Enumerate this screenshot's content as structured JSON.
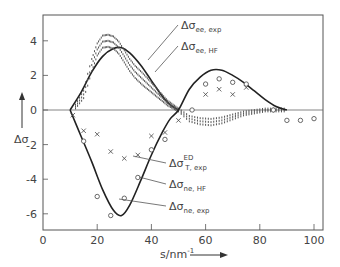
{
  "chart_data": {
    "type": "line",
    "title": "",
    "xlabel": "s/nm⁻¹",
    "ylabel": "Δσ",
    "xlim": [
      0,
      105
    ],
    "ylim": [
      -7,
      5.6
    ],
    "xticks": [
      0,
      20,
      40,
      60,
      80,
      100
    ],
    "yticks": [
      -6,
      -4,
      -2,
      0,
      2,
      4
    ],
    "grid": false,
    "zero_line": true,
    "series": [
      {
        "name": "Δσ_ee,HF",
        "style": "solid-line",
        "x": [
          10,
          14,
          18,
          22,
          26,
          29,
          32,
          36,
          40,
          44,
          47,
          50
        ],
        "y": [
          0,
          1.0,
          2.2,
          3.1,
          3.55,
          3.6,
          3.3,
          2.6,
          1.7,
          0.8,
          0.3,
          0
        ]
      },
      {
        "name": "Δσ_ee,exp",
        "style": "dotted-band",
        "x": [
          12,
          15,
          18,
          20,
          22,
          24,
          26,
          28,
          30,
          32,
          34,
          36,
          38,
          40,
          42,
          44,
          46,
          48,
          50,
          54,
          58,
          62,
          66,
          70,
          74,
          78,
          82,
          86,
          90
        ],
        "y": [
          0.2,
          0.9,
          2.6,
          3.5,
          3.95,
          4.0,
          3.9,
          3.6,
          3.1,
          2.6,
          2.2,
          1.9,
          1.6,
          1.3,
          1.0,
          0.7,
          0.4,
          0.2,
          0.0,
          -0.5,
          -0.65,
          -0.7,
          -0.6,
          -0.4,
          -0.2,
          -0.1,
          0.0,
          0.0,
          0.0
        ]
      },
      {
        "name": "Δσ_ne,HF",
        "style": "solid-line",
        "x": [
          10,
          14,
          18,
          22,
          26,
          29,
          32,
          36,
          40,
          44,
          47,
          50,
          54,
          58,
          62,
          66,
          70,
          74,
          78,
          82,
          86,
          90
        ],
        "y": [
          0,
          -1.5,
          -3.0,
          -4.6,
          -5.8,
          -6.1,
          -5.5,
          -4.1,
          -2.6,
          -1.3,
          -0.5,
          0,
          1.2,
          1.9,
          2.3,
          2.3,
          2.0,
          1.6,
          1.1,
          0.6,
          0.2,
          0
        ]
      },
      {
        "name": "Δσ_ne,exp",
        "style": "circles",
        "x": [
          15,
          20,
          25,
          30,
          35,
          40,
          45,
          55,
          60,
          65,
          70,
          75,
          85,
          90,
          95,
          100
        ],
        "y": [
          -1.8,
          -5.0,
          -6.1,
          -5.1,
          -3.9,
          -2.3,
          -1.7,
          0,
          1.5,
          1.8,
          1.6,
          1.5,
          0,
          -0.6,
          -0.6,
          -0.5
        ]
      },
      {
        "name": "Δσ_T,exp^ED",
        "style": "crosses",
        "x": [
          11,
          15,
          20,
          25,
          30,
          35,
          40,
          45,
          50,
          60,
          65,
          70,
          75
        ],
        "y": [
          -0.3,
          -1.2,
          -1.4,
          -2.4,
          -2.8,
          -2.6,
          -1.5,
          -1.3,
          -0.6,
          0.9,
          1.2,
          0.9,
          1.3
        ]
      }
    ],
    "legend": {
      "position": "inline-annotations",
      "entries": [
        {
          "base": "Δσ",
          "sub": "ee, exp",
          "sup": ""
        },
        {
          "base": "Δσ",
          "sub": "ee, HF",
          "sup": ""
        },
        {
          "base": "Δσ",
          "sub": "T, exp",
          "sup": "ED"
        },
        {
          "base": "Δσ",
          "sub": "ne, HF",
          "sup": ""
        },
        {
          "base": "Δσ",
          "sub": "ne, exp",
          "sup": ""
        }
      ]
    }
  },
  "axes": {
    "x_label_text": "s/nm",
    "x_label_sup": "-1",
    "y_label_text": "Δσ"
  }
}
